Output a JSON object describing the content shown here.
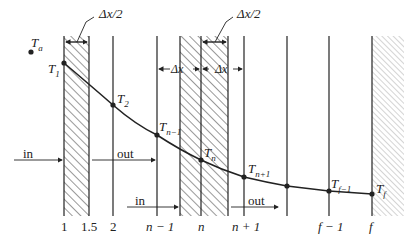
{
  "diagram": {
    "ambient_label": "T",
    "ambient_sub": "a",
    "dimension_labels": {
      "half_dx_left": "Δx/2",
      "half_dx_center": "Δx/2",
      "dx_left": "Δx",
      "dx_right": "Δx"
    },
    "nodes": [
      {
        "label": "T",
        "sub": "1"
      },
      {
        "label": "T",
        "sub": "2"
      },
      {
        "label": "T",
        "sub": "n−1"
      },
      {
        "label": "T",
        "sub": "n"
      },
      {
        "label": "T",
        "sub": "n+1"
      },
      {
        "label": "T",
        "sub": "f−1"
      },
      {
        "label": "T",
        "sub": "f"
      }
    ],
    "flow_labels": {
      "in_1": "in",
      "out_1": "out",
      "in_2": "in",
      "out_2": "out"
    },
    "axis_labels": [
      "1",
      "1.5",
      "2",
      "n − 1",
      "n",
      "n + 1",
      "f − 1",
      "f"
    ],
    "colors": {
      "line": "#222222",
      "hatch": "#333333",
      "hatch_light": "#aaaaaa"
    }
  }
}
